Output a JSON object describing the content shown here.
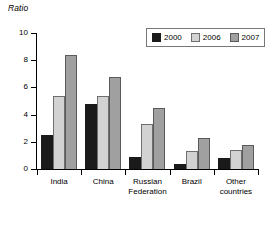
{
  "chart_data": {
    "type": "bar",
    "title": "",
    "subtitle": "",
    "xlabel": "",
    "ylabel": "Ratio",
    "ylim": [
      0,
      10
    ],
    "yticks": [
      0,
      2,
      4,
      6,
      8,
      10
    ],
    "ytick_labels": [
      "0",
      "2",
      "4",
      "6",
      "8",
      "10"
    ],
    "grid": false,
    "legend_position": "top-right",
    "categories": [
      "India",
      "China",
      "Russian\nFederation",
      "Brazil",
      "Other\ncountries"
    ],
    "series": [
      {
        "name": "2000",
        "color": "#1a1a1a",
        "values": [
          2.5,
          4.8,
          0.9,
          0.4,
          0.8
        ]
      },
      {
        "name": "2006",
        "color": "#d2d2d2",
        "values": [
          5.4,
          5.4,
          3.3,
          1.3,
          1.4
        ]
      },
      {
        "name": "2007",
        "color": "#a0a0a0",
        "values": [
          8.4,
          6.8,
          4.5,
          2.3,
          1.8
        ]
      }
    ]
  },
  "legend": {
    "items": [
      {
        "label": "2000"
      },
      {
        "label": "2006"
      },
      {
        "label": "2007"
      }
    ]
  }
}
